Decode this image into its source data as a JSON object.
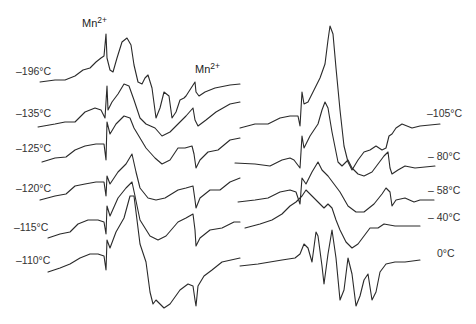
{
  "chart_data": {
    "type": "line",
    "title": "",
    "xlabel": "",
    "ylabel": "",
    "grid": false,
    "legend": "none",
    "annotations": [
      "Mn2+",
      "Mn2+"
    ],
    "panels": [
      {
        "name": "left",
        "series": [
          {
            "name": "-196°C",
            "label": "–196°C"
          },
          {
            "name": "-135°C",
            "label": "–135°C"
          },
          {
            "name": "-125°C",
            "label": "–125°C"
          },
          {
            "name": "-120°C",
            "label": "–120°C"
          },
          {
            "name": "-115°C",
            "label": "–115°C"
          },
          {
            "name": "-110°C",
            "label": "–110°C"
          }
        ]
      },
      {
        "name": "right",
        "series": [
          {
            "name": "-105°C",
            "label": "–105°C"
          },
          {
            "name": "-80°C",
            "label": "– 80°C"
          },
          {
            "name": "-58°C",
            "label": "– 58°C"
          },
          {
            "name": "-40°C",
            "label": "– 40°C"
          },
          {
            "name": "0°C",
            "label": "0°C"
          }
        ]
      }
    ],
    "mn_label": {
      "base": "Mn",
      "sup": "2+"
    }
  }
}
